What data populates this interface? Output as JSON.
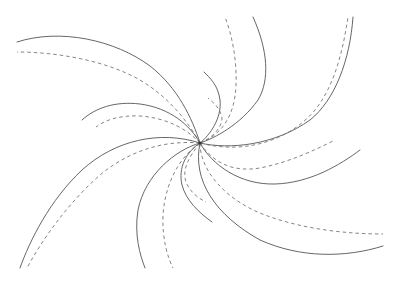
{
  "diagram": {
    "type": "spiral-vortex",
    "center": {
      "x": 200,
      "y": 143
    },
    "colors": {
      "background": "#ffffff",
      "solid_stroke": "#555555",
      "dashed_stroke": "#777777"
    },
    "arms": [
      {
        "name": "arm-upper-left",
        "solid": "M200,143 C185,120 150,105 120,104 C90,104 70,110 60,120",
        "dashed": "M200,143 C180,130 150,117 125,115 C105,114 90,118 80,123"
      },
      {
        "name": "arm-upper-left-outer",
        "solid": "M200,143 C190,100 170,60 140,40 C100,22 50,30 17,42",
        "dashed": "M200,143 C180,100 150,75 120,65 C80,52 40,52 17,52"
      },
      {
        "name": "arm-upper-right",
        "solid": "M200,143 C215,125 230,95 215,70 C205,55 195,52 190,55",
        "dashed": "M200,143 C210,125 225,115 222,120"
      },
      {
        "name": "arm-upper-right-outer",
        "solid": "M200,143 C215,140 260,120 265,80 C267,50 260,30 253,17",
        "dashed": "M200,143 C220,140 240,110 238,70 C236,45 230,30 225,17"
      },
      {
        "name": "arm-right",
        "solid": "M200,143 C215,160 250,185 300,180 C330,176 360,155 380,140",
        "dashed": "M200,143 C215,165 250,175 290,160 C320,148 350,120 370,100"
      },
      {
        "name": "arm-right-outer",
        "solid": "M200,143 C230,150 300,100 330,60 C345,40 350,25 353,17",
        "dashed": "M200,143 C240,150 300,110 325,75 C338,55 345,35 348,17"
      },
      {
        "name": "arm-lower-right",
        "solid": "M200,143 C190,180 220,230 300,255 C330,262 360,258 383,247",
        "dashed": "M200,143 C200,175 240,215 300,228 C340,236 370,234 383,234"
      },
      {
        "name": "arm-lower-left",
        "solid": "M200,143 C180,150 175,170 178,190 C182,215 195,240 200,235",
        "dashed": "M200,143 C180,160 180,175 190,195"
      },
      {
        "name": "arm-lower-mid",
        "solid": "M200,143 C175,150 140,180 138,220 C137,245 142,260 145,268",
        "dashed": "M200,143 C170,160 160,190 160,225 C161,245 166,260 173,268"
      },
      {
        "name": "arm-lower-left-outer",
        "solid": "M200,143 C150,130 100,150 60,200 C38,230 25,255 20,268",
        "dashed": "M200,143 C160,140 110,165 75,210 C55,235 35,255 27,268"
      }
    ]
  }
}
